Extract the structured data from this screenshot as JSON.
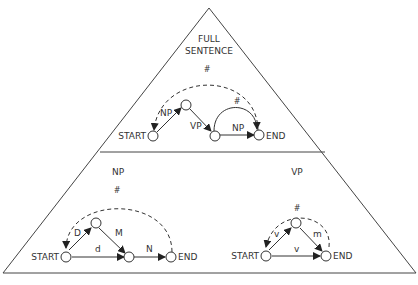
{
  "diagram": {
    "type": "transition-network-hierarchy",
    "colors": {
      "line": "#333333",
      "background": "#ffffff"
    },
    "sections": {
      "full_sentence": {
        "title_line1": "FULL",
        "title_line2": "SENTENCE",
        "start_label": "START",
        "end_label": "END",
        "edges": {
          "np": "NP",
          "vp": "VP",
          "np2": "NP",
          "hash_outer": "#",
          "hash_inner": "#"
        }
      },
      "np": {
        "title": "NP",
        "start_label": "START",
        "end_label": "END",
        "edges": {
          "D": "D",
          "M": "M",
          "d": "d",
          "N": "N",
          "hash": "#"
        }
      },
      "vp": {
        "title": "VP",
        "start_label": "START",
        "end_label": "END",
        "edges": {
          "v1": "v",
          "m": "m",
          "v2": "v",
          "hash": "#"
        }
      }
    }
  }
}
